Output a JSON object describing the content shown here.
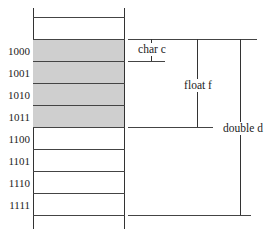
{
  "diagram": {
    "rows": [
      {
        "address": "",
        "shaded": false
      },
      {
        "address": "1000",
        "shaded": true
      },
      {
        "address": "1001",
        "shaded": true
      },
      {
        "address": "1010",
        "shaded": true
      },
      {
        "address": "1011",
        "shaded": true
      },
      {
        "address": "1100",
        "shaded": false
      },
      {
        "address": "1101",
        "shaded": false
      },
      {
        "address": "1110",
        "shaded": false
      },
      {
        "address": "1111",
        "shaded": false
      }
    ],
    "brackets": [
      {
        "label": "char c",
        "start_address": "1000",
        "size_bytes": 1
      },
      {
        "label": "float f",
        "start_address": "1000",
        "size_bytes": 4
      },
      {
        "label": "double d",
        "start_address": "1000",
        "size_bytes": 8
      }
    ],
    "colors": {
      "shaded_fill": "#cfcfcf",
      "line": "#333333",
      "background": "#ffffff"
    }
  }
}
